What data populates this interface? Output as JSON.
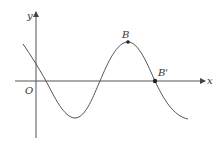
{
  "figure": {
    "axes": {
      "x_label": "x",
      "y_label": "y",
      "origin_label": "O",
      "axis_color": "#555555"
    },
    "curve": {
      "type": "sinusoid",
      "color": "#555555",
      "description": "Sinusoidal curve: descends crossing y-axis above origin, reaches a minimum below x-axis, rises to maximum at B, then descends through B' on the x-axis"
    },
    "points": [
      {
        "label": "B",
        "role": "maximum"
      },
      {
        "label": "B'",
        "role": "x-axis crossing"
      }
    ]
  }
}
